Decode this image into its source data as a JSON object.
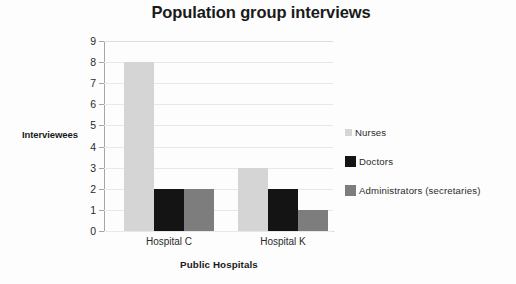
{
  "chart_data": {
    "type": "bar",
    "title": "Population group interviews",
    "xlabel": "Public Hospitals",
    "ylabel": "Interviewees",
    "categories": [
      "Hospital C",
      "Hospital K"
    ],
    "series": [
      {
        "name": "Nurses",
        "values": [
          8,
          3
        ],
        "color": "#d5d5d5"
      },
      {
        "name": "Doctors",
        "values": [
          2,
          2
        ],
        "color": "#141414"
      },
      {
        "name": "Administrators (secretaries)",
        "values": [
          2,
          1
        ],
        "color": "#7d7d7d"
      }
    ],
    "ylim": [
      0,
      9
    ],
    "yticks": [
      0,
      1,
      2,
      3,
      4,
      5,
      6,
      7,
      8,
      9
    ],
    "ytick_labels": [
      "0",
      "1",
      "2",
      "3",
      "4",
      "5",
      "6",
      "7",
      "8",
      "9"
    ],
    "grid": true,
    "grid_axis": "y",
    "legend_position": "right",
    "background_color": "#ffffff",
    "grid_color": "#e8e8e8",
    "axis_color": "#a6a6a6",
    "text_color": "#231f20"
  },
  "axis": {
    "y_title": "Interviewees",
    "x_title": "Public Hospitals",
    "y_labels": [
      "9",
      "8",
      "7",
      "6",
      "5",
      "4",
      "3",
      "2",
      "1",
      "0"
    ],
    "x_labels": [
      "Hospital C",
      "Hospital K"
    ]
  },
  "legend": {
    "items": [
      {
        "label": "Nurses"
      },
      {
        "label": "Doctors"
      },
      {
        "label": "Administrators (secretaries)"
      }
    ]
  },
  "title": "Population group interviews"
}
